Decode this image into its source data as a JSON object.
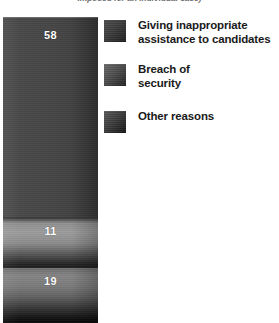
{
  "caption": "imposed for an individual case)",
  "chart_data": {
    "type": "bar",
    "subtype": "stacked-single-bar",
    "title": "",
    "subtitle": "imposed for an individual case)",
    "xlabel": "",
    "ylabel": "",
    "orientation": "vertical",
    "grid": false,
    "legend_position": "right",
    "categories": [
      "Giving inappropriate assistance to candidates",
      "Breach of security",
      "Other reasons"
    ],
    "values": [
      58,
      11,
      19
    ],
    "value_labels": [
      "58",
      "11",
      "19"
    ],
    "total": 88,
    "series": [
      {
        "name": "Giving inappropriate assistance to candidates",
        "value": 58,
        "color": "#454545"
      },
      {
        "name": "Breach of security",
        "value": 11,
        "color": "#9b9b9b"
      },
      {
        "name": "Other reasons",
        "value": 19,
        "color": "#7a7a7a"
      }
    ]
  },
  "bar": {
    "segments": [
      {
        "value_label": "58",
        "name": "giving-inappropriate-assistance"
      },
      {
        "value_label": "11",
        "name": "breach-of-security"
      },
      {
        "value_label": "19",
        "name": "other-reasons"
      }
    ]
  },
  "legend": {
    "items": [
      {
        "label": "Giving inappropriate\nassistance to candidates",
        "swatch_color": "#3c3c3c"
      },
      {
        "label": "Breach of\nsecurity",
        "swatch_color": "#4a4a4a"
      },
      {
        "label": "Other reasons",
        "swatch_color": "#3a3a3a"
      }
    ]
  }
}
